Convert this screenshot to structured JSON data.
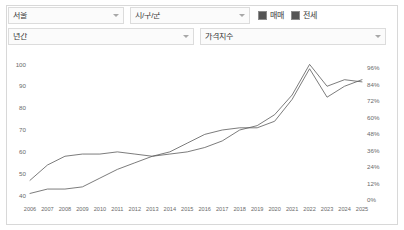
{
  "controls": {
    "region": {
      "label": "서울",
      "caret": "chevron-down-icon"
    },
    "area": {
      "label": "시/구/군",
      "caret": "chevron-down-icon"
    },
    "period": {
      "label": "년간",
      "caret": "chevron-down-icon"
    },
    "metric": {
      "label": "가격지수",
      "caret": "chevron-down-icon"
    }
  },
  "legend": {
    "items": [
      {
        "label": "매매",
        "color": "#555555",
        "checked": true
      },
      {
        "label": "전세",
        "color": "#555555",
        "checked": true
      }
    ]
  },
  "chart_data": {
    "type": "line",
    "title": "",
    "xlabel": "",
    "ylabel": "",
    "grid": false,
    "legend_position": "top-right",
    "x": [
      2006,
      2007,
      2008,
      2009,
      2010,
      2011,
      2012,
      2013,
      2014,
      2015,
      2016,
      2017,
      2018,
      2019,
      2020,
      2021,
      2022,
      2023,
      2024,
      2025
    ],
    "categories": [
      "2006",
      "2007",
      "2008",
      "2009",
      "2010",
      "2011",
      "2012",
      "2013",
      "2014",
      "2015",
      "2016",
      "2017",
      "2018",
      "2019",
      "2020",
      "2021",
      "2022",
      "2023",
      "2024",
      "2025"
    ],
    "left_axis": {
      "ticks": [
        40,
        50,
        60,
        70,
        80,
        90,
        100
      ],
      "ylim": [
        38,
        102
      ],
      "label": ""
    },
    "right_axis": {
      "ticks": [
        "0%",
        "12%",
        "24%",
        "36%",
        "48%",
        "60%",
        "72%",
        "84%",
        "96%"
      ],
      "tick_values": [
        0,
        12,
        24,
        36,
        48,
        60,
        72,
        84,
        96
      ],
      "ylim": [
        0,
        102
      ],
      "label": ""
    },
    "series": [
      {
        "name": "매매",
        "axis": "left",
        "color": "#5a5a5a",
        "values": [
          47,
          54,
          58,
          59,
          59,
          60,
          59,
          58,
          59,
          60,
          62,
          65,
          70,
          72,
          77,
          86,
          100,
          90,
          93,
          92
        ]
      },
      {
        "name": "전세",
        "axis": "left",
        "color": "#5a5a5a",
        "values": [
          41,
          43,
          43,
          44,
          48,
          52,
          55,
          58,
          60,
          64,
          68,
          70,
          71,
          71,
          74,
          84,
          98,
          85,
          90,
          93
        ]
      }
    ]
  }
}
